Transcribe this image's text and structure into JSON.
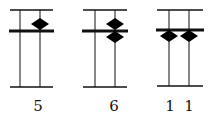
{
  "diagram": {
    "type": "abacus",
    "colors": {
      "line": "#111111",
      "bead": "#000000",
      "background": "#ffffff"
    },
    "abacuses": [
      {
        "label": "5",
        "frame": {
          "x1": 10,
          "x2": 53,
          "top": 10,
          "beam": 31,
          "bottom": 87
        },
        "rods": [
          {
            "x": 20,
            "beads_upper": 0,
            "beads_lower": 0
          },
          {
            "x": 40,
            "beads_upper": 1,
            "beads_lower": 0
          }
        ],
        "label_x": 38
      },
      {
        "label": "6",
        "frame": {
          "x1": 83,
          "x2": 127,
          "top": 10,
          "beam": 31,
          "bottom": 87
        },
        "rods": [
          {
            "x": 95,
            "beads_upper": 0,
            "beads_lower": 0
          },
          {
            "x": 115,
            "beads_upper": 1,
            "beads_lower": 1
          }
        ],
        "label_x": 115
      },
      {
        "label": "1 1",
        "frame": {
          "x1": 157,
          "x2": 203,
          "top": 10,
          "beam": 30,
          "bottom": 86
        },
        "rods": [
          {
            "x": 169,
            "beads_upper": 0,
            "beads_lower": 1
          },
          {
            "x": 189,
            "beads_upper": 0,
            "beads_lower": 1
          }
        ],
        "label_x": 179
      }
    ],
    "labels": [
      {
        "text": "5",
        "x": 38
      },
      {
        "text": "6",
        "x": 114
      },
      {
        "text": "1",
        "x": 170
      },
      {
        "text": "1",
        "x": 189
      }
    ]
  }
}
